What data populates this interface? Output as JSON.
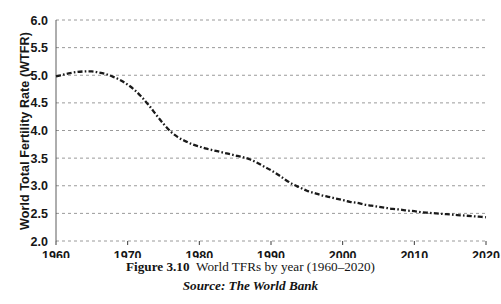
{
  "caption": {
    "figure_label": "Figure 3.10",
    "figure_text": "World TFRs by year (1960–2020)",
    "source": "Source: The World Bank"
  },
  "colors": {
    "line": "#1a1a1a",
    "grid": "#9a9a9a",
    "text": "#161616",
    "background": "#ffffff"
  },
  "chart_data": {
    "type": "line",
    "title": "",
    "xlabel": "",
    "ylabel": "World Total Fertility Rate (WTFR)",
    "xlim": [
      1960,
      2020
    ],
    "ylim": [
      2.0,
      6.0
    ],
    "grid": true,
    "legend": "none",
    "xticks": [
      "1960",
      "1970",
      "1980",
      "1990",
      "2000",
      "2010",
      "2020"
    ],
    "yticks": [
      "2.0",
      "2.5",
      "3.0",
      "3.5",
      "4.0",
      "4.5",
      "5.0",
      "5.5",
      "6.0"
    ],
    "line_style": "dash-dot",
    "x": [
      1960,
      1961,
      1962,
      1963,
      1964,
      1965,
      1966,
      1967,
      1968,
      1969,
      1970,
      1971,
      1972,
      1973,
      1974,
      1975,
      1976,
      1977,
      1978,
      1979,
      1980,
      1981,
      1982,
      1983,
      1984,
      1985,
      1986,
      1987,
      1988,
      1989,
      1990,
      1991,
      1992,
      1993,
      1994,
      1995,
      1996,
      1997,
      1998,
      1999,
      2000,
      2001,
      2002,
      2003,
      2004,
      2005,
      2006,
      2007,
      2008,
      2009,
      2010,
      2011,
      2012,
      2013,
      2014,
      2015,
      2016,
      2017,
      2018,
      2019,
      2020
    ],
    "values": [
      4.98,
      5.01,
      5.04,
      5.06,
      5.07,
      5.07,
      5.05,
      5.02,
      4.97,
      4.91,
      4.83,
      4.73,
      4.6,
      4.45,
      4.28,
      4.12,
      3.98,
      3.88,
      3.81,
      3.75,
      3.71,
      3.67,
      3.64,
      3.61,
      3.58,
      3.55,
      3.52,
      3.48,
      3.42,
      3.35,
      3.28,
      3.2,
      3.11,
      3.03,
      2.97,
      2.91,
      2.87,
      2.83,
      2.8,
      2.77,
      2.74,
      2.71,
      2.69,
      2.66,
      2.64,
      2.62,
      2.6,
      2.58,
      2.57,
      2.55,
      2.54,
      2.52,
      2.51,
      2.5,
      2.49,
      2.48,
      2.47,
      2.46,
      2.45,
      2.44,
      2.43
    ],
    "series_name": "World Total Fertility Rate"
  }
}
